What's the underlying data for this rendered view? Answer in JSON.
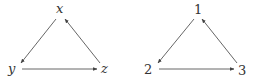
{
  "graphs": [
    {
      "name": "letter-graph",
      "nodes": [
        {
          "id": "x",
          "label": "x",
          "pos": [
            60,
            13
          ]
        },
        {
          "id": "y",
          "label": "y",
          "pos": [
            15,
            69
          ]
        },
        {
          "id": "z",
          "label": "z",
          "pos": [
            105,
            69
          ]
        }
      ],
      "edges": [
        {
          "from": "x",
          "to": "y"
        },
        {
          "from": "y",
          "to": "z"
        },
        {
          "from": "z",
          "to": "x"
        }
      ]
    },
    {
      "name": "number-graph",
      "nodes": [
        {
          "id": "1",
          "label": "1",
          "pos": [
            198,
            13
          ]
        },
        {
          "id": "2",
          "label": "2",
          "pos": [
            151,
            69
          ]
        },
        {
          "id": "3",
          "label": "3",
          "pos": [
            242,
            69
          ]
        }
      ],
      "edges": [
        {
          "from": "1",
          "to": "2"
        },
        {
          "from": "2",
          "to": "3"
        },
        {
          "from": "3",
          "to": "1"
        }
      ]
    }
  ],
  "colors": {
    "edge": "#555555",
    "label": "#333333",
    "background": "#ffffff"
  }
}
